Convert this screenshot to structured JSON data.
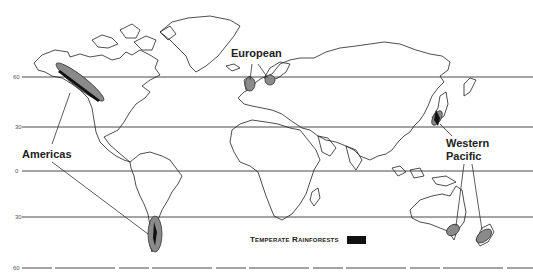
{
  "map": {
    "title_legend": "Temperate Rainforests",
    "legend_swatch_color": "#111111",
    "region_fill_color": "#8a8a8a",
    "latitude_lines": [
      {
        "label": "60",
        "y": 77
      },
      {
        "label": "30",
        "y": 127
      },
      {
        "label": "0",
        "y": 171
      },
      {
        "label": "30",
        "y": 217
      },
      {
        "label": "60",
        "y": 268
      }
    ],
    "regions": [
      {
        "name": "Americas",
        "label": "Americas"
      },
      {
        "name": "European",
        "label": "European"
      },
      {
        "name": "Western Pacific",
        "label_line1": "Western",
        "label_line2": "Pacific"
      }
    ]
  }
}
